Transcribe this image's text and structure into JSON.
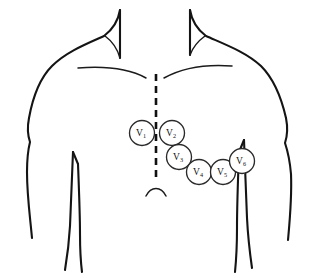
{
  "diagram": {
    "view": "anterior torso outline",
    "background_color": "#ffffff",
    "line_color": "#141414",
    "electrode_fill": "#ffffff",
    "electrode_stroke": "#2a2a2a"
  },
  "anatomy": {
    "midline": {
      "name": "sternal midline",
      "style": "dashed",
      "color": "#111111"
    },
    "clavicle_left": {
      "name": "left clavicle"
    },
    "clavicle_right": {
      "name": "right clavicle"
    },
    "xiphoid": {
      "name": "xiphoid process / costal arch"
    },
    "axillary_line": {
      "name": "mid-axillary line"
    },
    "neck": {
      "name": "neck"
    },
    "shoulder_left": {
      "name": "left shoulder"
    },
    "shoulder_right": {
      "name": "right shoulder"
    },
    "arm_left": {
      "name": "left arm"
    },
    "arm_right": {
      "name": "right arm"
    }
  },
  "electrodes": [
    {
      "id": "V1",
      "letter": "V",
      "sub": "1",
      "cx": 142,
      "cy": 133,
      "r": 12.5
    },
    {
      "id": "V2",
      "letter": "V",
      "sub": "2",
      "cx": 172,
      "cy": 133,
      "r": 12.5
    },
    {
      "id": "V3",
      "letter": "V",
      "sub": "3",
      "cx": 179,
      "cy": 157,
      "r": 12.5
    },
    {
      "id": "V4",
      "letter": "V",
      "sub": "4",
      "cx": 199,
      "cy": 172,
      "r": 12.5
    },
    {
      "id": "V5",
      "letter": "V",
      "sub": "5",
      "cx": 223,
      "cy": 172,
      "r": 12.5
    },
    {
      "id": "V6",
      "letter": "V",
      "sub": "6",
      "cx": 242,
      "cy": 161,
      "r": 12.5
    }
  ]
}
